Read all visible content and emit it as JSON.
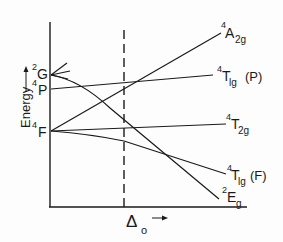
{
  "diagram": {
    "type": "Tanabe-Sugano / energy level correlation diagram (d3 octahedral)",
    "y_axis": {
      "label": "Energy",
      "arrow": "up-arrow"
    },
    "x_axis": {
      "label_main": "Δ",
      "label_sub": "o",
      "arrow": "right-arrow"
    },
    "free_ion_terms": [
      {
        "sup": "2",
        "letter": "G"
      },
      {
        "sup": "4",
        "letter": "P"
      },
      {
        "sup": "4",
        "letter": "F"
      }
    ],
    "states": [
      {
        "sup": "4",
        "letter": "A",
        "sub": "2g",
        "suffix": ""
      },
      {
        "sup": "4",
        "letter": "T",
        "sub": "lg",
        "suffix": "(P)"
      },
      {
        "sup": "4",
        "letter": "T",
        "sub": "2g",
        "suffix": ""
      },
      {
        "sup": "4",
        "letter": "T",
        "sub": "lg",
        "suffix": "(F)"
      },
      {
        "sup": "2",
        "letter": "E",
        "sub": "g",
        "suffix": ""
      }
    ],
    "colors": {
      "line": "#1a1a1a",
      "background": "#fdfdfd"
    }
  }
}
